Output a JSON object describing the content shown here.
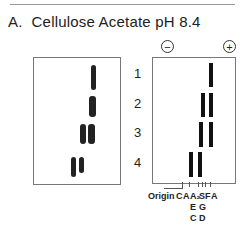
{
  "title": {
    "label": "A.",
    "text": "Cellulose Acetate pH 8.4"
  },
  "poles": {
    "negative": "−",
    "positive": "+"
  },
  "lanes": [
    "1",
    "2",
    "3",
    "4"
  ],
  "origin_label": "Origin",
  "markers": {
    "row1": [
      "C",
      "A",
      "A₂",
      "S",
      "F",
      "A"
    ],
    "row2": [
      "E",
      "G"
    ],
    "row3": [
      "C",
      "D"
    ]
  },
  "colors": {
    "band": "#111111",
    "box_border": "#777777"
  }
}
